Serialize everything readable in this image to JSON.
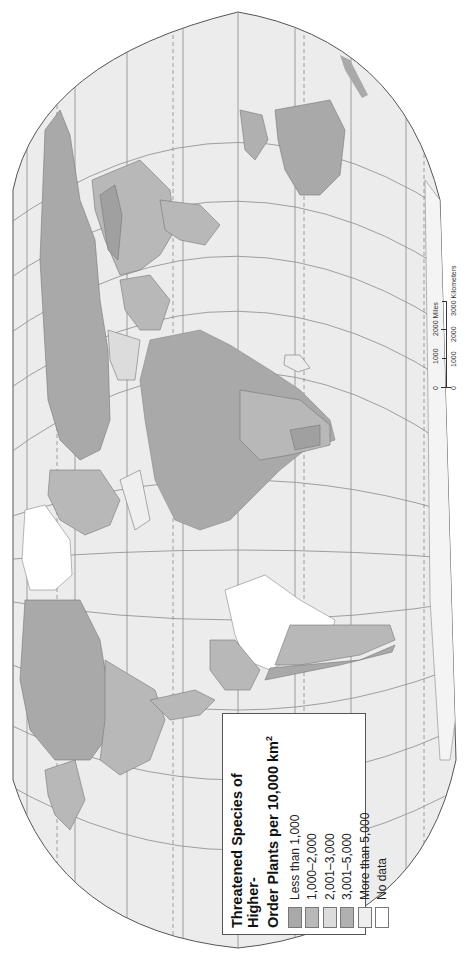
{
  "map": {
    "title": "Threatened Species of Higher-Order Plants per 10,000 km²",
    "title_line1": "Threatened Species of Higher-",
    "title_line2": "Order Plants per 10,000 km",
    "title_sup": "2",
    "orientation": "rotated 90° counter-clockwise",
    "projection_outline_color": "#555555",
    "ocean_color": "#ececec",
    "graticule_color": "#8a8a8a"
  },
  "legend": {
    "items": [
      {
        "label": "Less than 1,000",
        "color": "#a9a9a9"
      },
      {
        "label": "1,000–2,000",
        "color": "#b8b8b8"
      },
      {
        "label": "2,001–3,000",
        "color": "#dcdcdc"
      },
      {
        "label": "3,001–5,000",
        "color": "#b0b0b0"
      },
      {
        "label": "More than 5,000",
        "color": "#efefef"
      },
      {
        "label": "No data",
        "color": "#ffffff"
      }
    ]
  },
  "scale_bar": {
    "miles": {
      "ticks": [
        "0",
        "1000",
        "2000"
      ],
      "unit": "Miles",
      "label": "2000 Miles"
    },
    "kilometers": {
      "ticks": [
        "0",
        "1000",
        "2000",
        "3000"
      ],
      "unit": "Kilometers",
      "label": "3000 Kilometers"
    }
  },
  "regions": [
    {
      "name": "Russia / Northern Asia",
      "class": "Less than 1,000"
    },
    {
      "name": "China",
      "class": "1,000–2,000"
    },
    {
      "name": "Middle East",
      "class": "2,001–3,000"
    },
    {
      "name": "Africa (central)",
      "class": "Less than 1,000"
    },
    {
      "name": "Africa (south)",
      "class": "1,000–2,000"
    },
    {
      "name": "Australia",
      "class": "Less than 1,000"
    },
    {
      "name": "Greenland",
      "class": "No data"
    },
    {
      "name": "Canada",
      "class": "Less than 1,000"
    },
    {
      "name": "United States",
      "class": "1,000–2,000"
    },
    {
      "name": "Brazil",
      "class": "No data"
    },
    {
      "name": "Argentina / Chile",
      "class": "1,000–2,000"
    }
  ]
}
